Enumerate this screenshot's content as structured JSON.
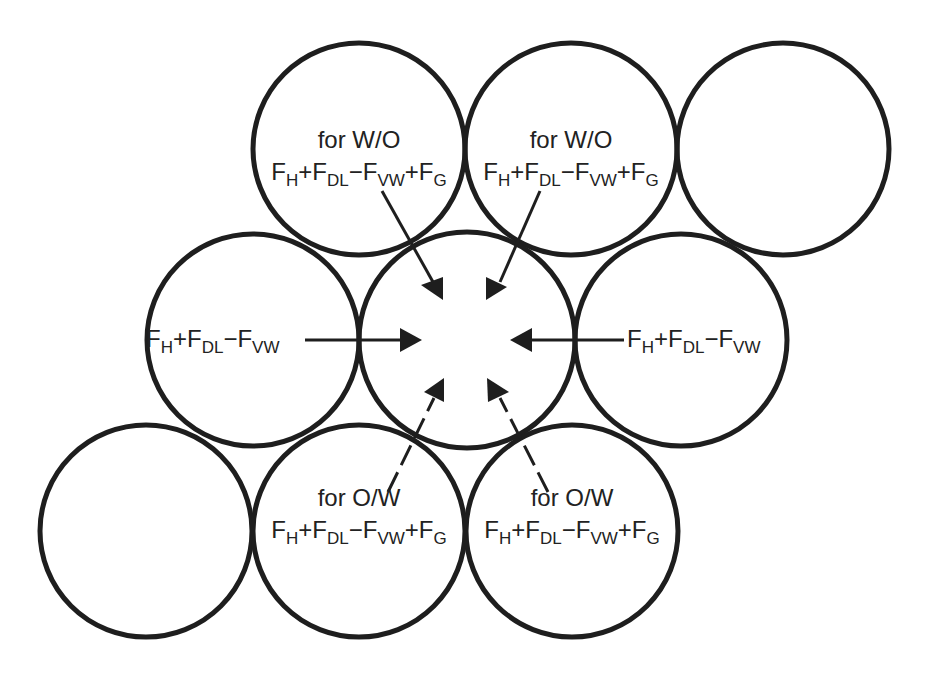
{
  "diagram": {
    "labels": {
      "top_left": {
        "line1": "for W/O",
        "terms": [
          {
            "sym": "F",
            "sub": "H",
            "op_after": "+"
          },
          {
            "sym": "F",
            "sub": "DL",
            "op_after": "−"
          },
          {
            "sym": "F",
            "sub": "VW",
            "op_after": "+"
          },
          {
            "sym": "F",
            "sub": "G",
            "op_after": ""
          }
        ]
      },
      "top_right": {
        "line1": "for W/O",
        "terms": [
          {
            "sym": "F",
            "sub": "H",
            "op_after": "+"
          },
          {
            "sym": "F",
            "sub": "DL",
            "op_after": "−"
          },
          {
            "sym": "F",
            "sub": "VW",
            "op_after": "+"
          },
          {
            "sym": "F",
            "sub": "G",
            "op_after": ""
          }
        ]
      },
      "middle_left": {
        "terms": [
          {
            "sym": "F",
            "sub": "H",
            "op_after": "+"
          },
          {
            "sym": "F",
            "sub": "DL",
            "op_after": "−"
          },
          {
            "sym": "F",
            "sub": "VW",
            "op_after": ""
          }
        ]
      },
      "middle_right": {
        "terms": [
          {
            "sym": "F",
            "sub": "H",
            "op_after": "+"
          },
          {
            "sym": "F",
            "sub": "DL",
            "op_after": "−"
          },
          {
            "sym": "F",
            "sub": "VW",
            "op_after": ""
          }
        ]
      },
      "bottom_left": {
        "line1": "for O/W",
        "terms": [
          {
            "sym": "F",
            "sub": "H",
            "op_after": "+"
          },
          {
            "sym": "F",
            "sub": "DL",
            "op_after": "−"
          },
          {
            "sym": "F",
            "sub": "VW",
            "op_after": "+"
          },
          {
            "sym": "F",
            "sub": "G",
            "op_after": ""
          }
        ]
      },
      "bottom_right": {
        "line1": "for O/W",
        "terms": [
          {
            "sym": "F",
            "sub": "H",
            "op_after": "+"
          },
          {
            "sym": "F",
            "sub": "DL",
            "op_after": "−"
          },
          {
            "sym": "F",
            "sub": "VW",
            "op_after": "+"
          },
          {
            "sym": "F",
            "sub": "G",
            "op_after": ""
          }
        ]
      }
    },
    "circles": [
      {
        "id": "top-left",
        "cx": 359,
        "cy": 149,
        "r": 106
      },
      {
        "id": "top-middle",
        "cx": 571,
        "cy": 149,
        "r": 106
      },
      {
        "id": "top-right",
        "cx": 783,
        "cy": 149,
        "r": 106
      },
      {
        "id": "middle-left",
        "cx": 253,
        "cy": 340,
        "r": 106
      },
      {
        "id": "center",
        "cx": 467,
        "cy": 340,
        "r": 108
      },
      {
        "id": "middle-right",
        "cx": 681,
        "cy": 340,
        "r": 106
      },
      {
        "id": "bottom-left",
        "cx": 146,
        "cy": 531,
        "r": 106
      },
      {
        "id": "bottom-middle",
        "cx": 359,
        "cy": 531,
        "r": 106
      },
      {
        "id": "bottom-right",
        "cx": 572,
        "cy": 531,
        "r": 106
      }
    ],
    "colors": {
      "stroke": "#1e1e1e",
      "text": "#222222",
      "background": "#ffffff"
    }
  }
}
